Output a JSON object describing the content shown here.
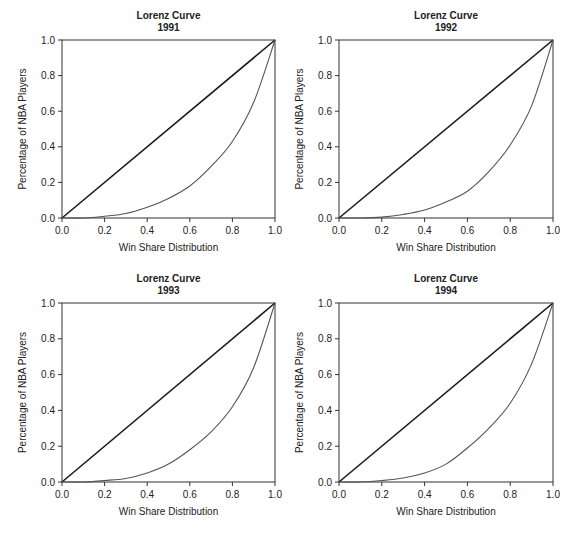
{
  "figure": {
    "layout": "2x2 grid",
    "line_colors": {
      "equality": "#1a1a1a",
      "lorenz": "#555555",
      "axes": "#333333"
    }
  },
  "chart_data": [
    {
      "type": "line",
      "title": "Lorenz Curve",
      "subtitle": "1991",
      "xlabel": "Win Share Distribution",
      "ylabel": "Percentage of NBA  Players",
      "xlim": [
        0,
        1
      ],
      "ylim": [
        0,
        1
      ],
      "xticks": [
        "0.0",
        "0.2",
        "0.4",
        "0.6",
        "0.8",
        "1.0"
      ],
      "yticks": [
        "0.0",
        "0.2",
        "0.4",
        "0.6",
        "0.8",
        "1.0"
      ],
      "grid": false,
      "legend": "none",
      "x": [
        0.0,
        0.1,
        0.2,
        0.3,
        0.4,
        0.5,
        0.6,
        0.7,
        0.8,
        0.9,
        1.0
      ],
      "series": [
        {
          "name": "Line of equality",
          "values": [
            0.0,
            0.1,
            0.2,
            0.3,
            0.4,
            0.5,
            0.6,
            0.7,
            0.8,
            0.9,
            1.0
          ]
        },
        {
          "name": "Lorenz curve",
          "values": [
            0.0,
            0.0,
            0.01,
            0.025,
            0.06,
            0.11,
            0.18,
            0.29,
            0.43,
            0.65,
            1.0
          ]
        }
      ]
    },
    {
      "type": "line",
      "title": "Lorenz Curve",
      "subtitle": "1992",
      "xlabel": "Win Share Distribution",
      "ylabel": "Percentage of NBA  Players",
      "xlim": [
        0,
        1
      ],
      "ylim": [
        0,
        1
      ],
      "xticks": [
        "0.0",
        "0.2",
        "0.4",
        "0.6",
        "0.8",
        "1.0"
      ],
      "yticks": [
        "0.0",
        "0.2",
        "0.4",
        "0.6",
        "0.8",
        "1.0"
      ],
      "grid": false,
      "legend": "none",
      "x": [
        0.0,
        0.1,
        0.2,
        0.3,
        0.4,
        0.5,
        0.6,
        0.7,
        0.8,
        0.9,
        1.0
      ],
      "series": [
        {
          "name": "Line of equality",
          "values": [
            0.0,
            0.1,
            0.2,
            0.3,
            0.4,
            0.5,
            0.6,
            0.7,
            0.8,
            0.9,
            1.0
          ]
        },
        {
          "name": "Lorenz curve",
          "values": [
            0.0,
            0.0,
            0.005,
            0.02,
            0.045,
            0.09,
            0.15,
            0.26,
            0.41,
            0.63,
            1.0
          ]
        }
      ]
    },
    {
      "type": "line",
      "title": "Lorenz Curve",
      "subtitle": "1993",
      "xlabel": "Win Share Distribution",
      "ylabel": "Percentage of NBA  Players",
      "xlim": [
        0,
        1
      ],
      "ylim": [
        0,
        1
      ],
      "xticks": [
        "0.0",
        "0.2",
        "0.4",
        "0.6",
        "0.8",
        "1.0"
      ],
      "yticks": [
        "0.0",
        "0.2",
        "0.4",
        "0.6",
        "0.8",
        "1.0"
      ],
      "grid": false,
      "legend": "none",
      "x": [
        0.0,
        0.1,
        0.2,
        0.3,
        0.4,
        0.5,
        0.6,
        0.7,
        0.8,
        0.9,
        1.0
      ],
      "series": [
        {
          "name": "Line of equality",
          "values": [
            0.0,
            0.1,
            0.2,
            0.3,
            0.4,
            0.5,
            0.6,
            0.7,
            0.8,
            0.9,
            1.0
          ]
        },
        {
          "name": "Lorenz curve",
          "values": [
            0.0,
            0.0,
            0.008,
            0.02,
            0.05,
            0.1,
            0.18,
            0.28,
            0.42,
            0.64,
            1.0
          ]
        }
      ]
    },
    {
      "type": "line",
      "title": "Lorenz Curve",
      "subtitle": "1994",
      "xlabel": "Win Share Distribution",
      "ylabel": "Percentage of NBA  Players",
      "xlim": [
        0,
        1
      ],
      "ylim": [
        0,
        1
      ],
      "xticks": [
        "0.0",
        "0.2",
        "0.4",
        "0.6",
        "0.8",
        "1.0"
      ],
      "yticks": [
        "0.0",
        "0.2",
        "0.4",
        "0.6",
        "0.8",
        "1.0"
      ],
      "grid": false,
      "legend": "none",
      "x": [
        0.0,
        0.1,
        0.2,
        0.3,
        0.4,
        0.5,
        0.6,
        0.7,
        0.8,
        0.9,
        1.0
      ],
      "series": [
        {
          "name": "Line of equality",
          "values": [
            0.0,
            0.1,
            0.2,
            0.3,
            0.4,
            0.5,
            0.6,
            0.7,
            0.8,
            0.9,
            1.0
          ]
        },
        {
          "name": "Lorenz curve",
          "values": [
            0.0,
            0.0,
            0.008,
            0.022,
            0.05,
            0.1,
            0.19,
            0.3,
            0.44,
            0.66,
            1.0
          ]
        }
      ]
    }
  ],
  "panels": [
    {
      "left": 62,
      "top": 40,
      "width": 213,
      "height": 178
    },
    {
      "left": 339,
      "top": 40,
      "width": 214,
      "height": 178
    },
    {
      "left": 62,
      "top": 303,
      "width": 213,
      "height": 179
    },
    {
      "left": 339,
      "top": 303,
      "width": 214,
      "height": 179
    }
  ]
}
